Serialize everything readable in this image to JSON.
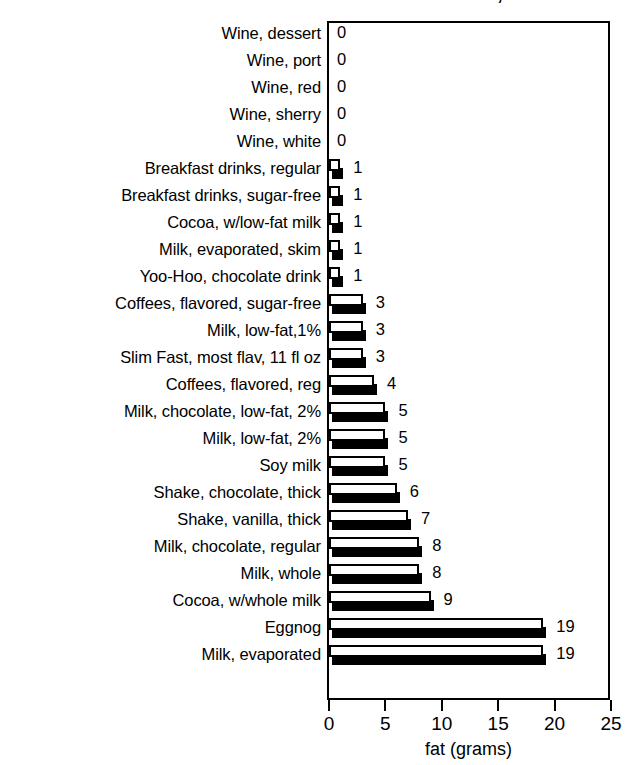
{
  "chart_data": {
    "type": "bar",
    "orientation": "horizontal",
    "title": "BEVERAGES, Part 3",
    "xlabel": "fat (grams)",
    "ylabel": "",
    "xlim": [
      0,
      25
    ],
    "xticks": [
      0,
      5,
      10,
      15,
      20,
      25
    ],
    "xtick_labels": [
      "0",
      "5",
      "10",
      "15",
      "20",
      "25"
    ],
    "grid": false,
    "legend": null,
    "style": "3d-shadowed-bars",
    "categories": [
      "Wine, dessert",
      "Wine, port",
      "Wine, red",
      "Wine, sherry",
      "Wine, white",
      "Breakfast drinks, regular",
      "Breakfast drinks, sugar-free",
      "Cocoa, w/low-fat milk",
      "Milk, evaporated, skim",
      "Yoo-Hoo, chocolate drink",
      "Coffees, flavored, sugar-free",
      "Milk, low-fat,1%",
      "Slim Fast, most flav, 11 fl oz",
      "Coffees, flavored, reg",
      "Milk, chocolate, low-fat, 2%",
      "Milk, low-fat, 2%",
      "Soy milk",
      "Shake, chocolate, thick",
      "Shake, vanilla, thick",
      "Milk, chocolate, regular",
      "Milk, whole",
      "Cocoa, w/whole milk",
      "Eggnog",
      "Milk, evaporated"
    ],
    "values": [
      0,
      0,
      0,
      0,
      0,
      1,
      1,
      1,
      1,
      1,
      3,
      3,
      3,
      4,
      5,
      5,
      5,
      6,
      7,
      8,
      8,
      9,
      19,
      19
    ],
    "value_labels": [
      "0",
      "0",
      "0",
      "0",
      "0",
      "1",
      "1",
      "1",
      "1",
      "1",
      "3",
      "3",
      "3",
      "4",
      "5",
      "5",
      "5",
      "6",
      "7",
      "8",
      "8",
      "9",
      "19",
      "19"
    ],
    "colors": {
      "bar_face": "#ffffff",
      "bar_outline": "#000000",
      "bar_shadow": "#000000",
      "background": "#ffffff",
      "text": "#000000"
    }
  }
}
